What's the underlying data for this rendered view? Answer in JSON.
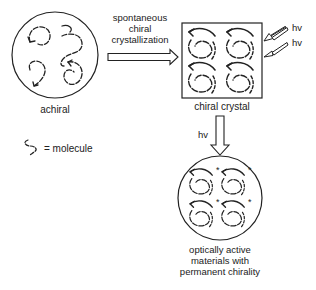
{
  "labels": {
    "achiral": "achiral",
    "molecule_legend": "= molecule",
    "process_line1": "spontaneous",
    "process_line2": "chiral",
    "process_line3": "crystallization",
    "chiral_crystal": "chiral crystal",
    "hv_top": "hv",
    "hv_bottom": "hv",
    "hv_down": "hv",
    "result_line1": "optically active",
    "result_line2": "materials with",
    "result_line3": "permanent chirality"
  },
  "crystal_grid": {
    "rows": 2,
    "cols": 2
  },
  "product_marker": "*"
}
